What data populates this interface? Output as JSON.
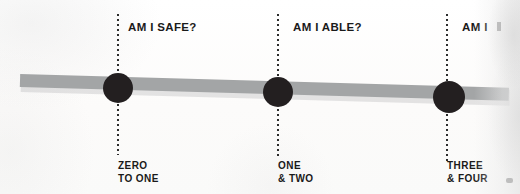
{
  "figure": {
    "type": "timeline-diagram",
    "background_color": "#fcfcfb",
    "bar_color": "#a3a5a6",
    "dot_color": "#231f20",
    "text_color": "#1a1a1a",
    "guide_color": "#2c2c2c"
  },
  "milestones": [
    {
      "id": "zero-to-one",
      "question": "AM I SAFE?",
      "stage_line1": "ZERO",
      "stage_line2": "TO ONE",
      "guide_x": 118,
      "dot_x": 118,
      "dot_y": 88,
      "dot_r": 15
    },
    {
      "id": "one-and-two",
      "question": "AM I ABLE?",
      "stage_line1": "ONE",
      "stage_line2": "& TWO",
      "guide_x": 278,
      "dot_x": 278,
      "dot_y": 92,
      "dot_r": 15
    },
    {
      "id": "three-and-four",
      "question": "AM I",
      "stage_line1": "THREE",
      "stage_line2": "& FOUR",
      "guide_x": 447,
      "dot_x": 449,
      "dot_y": 97,
      "dot_r": 16
    }
  ]
}
